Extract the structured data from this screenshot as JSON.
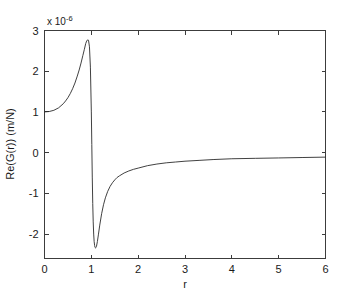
{
  "chart_data": {
    "type": "line",
    "title": "",
    "subtitle": "",
    "xlabel": "r",
    "ylabel": "Re(G(r)) (m/N)",
    "y_multiplier": "x 10",
    "y_multiplier_exponent": "-6",
    "y_multiplier_full": "x 10^-6",
    "xlim": [
      0,
      6
    ],
    "ylim": [
      -2.6,
      3
    ],
    "xticks": [
      0,
      1,
      2,
      3,
      4,
      5,
      6
    ],
    "xtick_labels": [
      "0",
      "1",
      "2",
      "3",
      "4",
      "5",
      "6"
    ],
    "yticks": [
      -2,
      -1,
      0,
      1,
      2,
      3
    ],
    "ytick_labels": [
      "-2",
      "-1",
      "0",
      "1",
      "2",
      "3"
    ],
    "grid": false,
    "legend": null,
    "legend_position": "none",
    "line_color": "#2b2b2b",
    "axis_color": "#3c3c3c",
    "background_color": "#ffffff",
    "annotations": [
      {
        "name": "resonance-peak",
        "x": 0.94,
        "y": 2.77
      },
      {
        "name": "resonance-trough",
        "x": 1.11,
        "y": -2.34
      },
      {
        "name": "left-endpoint",
        "x": 0.0,
        "y": 1.0
      },
      {
        "name": "right-endpoint",
        "x": 6.0,
        "y": -0.11
      }
    ],
    "series": [
      {
        "name": "Re(G(r))",
        "x": [
          0.0,
          0.1,
          0.2,
          0.3,
          0.4,
          0.45,
          0.5,
          0.55,
          0.6,
          0.65,
          0.7,
          0.74,
          0.78,
          0.82,
          0.85,
          0.88,
          0.9,
          0.92,
          0.94,
          0.96,
          0.98,
          1.0,
          1.01,
          1.02,
          1.03,
          1.04,
          1.05,
          1.06,
          1.07,
          1.08,
          1.09,
          1.1,
          1.11,
          1.13,
          1.15,
          1.18,
          1.22,
          1.26,
          1.3,
          1.35,
          1.4,
          1.45,
          1.5,
          1.55,
          1.6,
          1.7,
          1.8,
          1.9,
          2.0,
          2.2,
          2.4,
          2.6,
          2.8,
          3.0,
          3.3,
          3.6,
          4.0,
          4.5,
          5.0,
          5.5,
          6.0
        ],
        "y": [
          1.0,
          1.01,
          1.04,
          1.1,
          1.2,
          1.27,
          1.35,
          1.45,
          1.57,
          1.71,
          1.88,
          2.03,
          2.2,
          2.39,
          2.53,
          2.68,
          2.74,
          2.77,
          2.76,
          2.6,
          2.1,
          1.0,
          0.2,
          -0.6,
          -1.25,
          -1.7,
          -2.0,
          -2.18,
          -2.28,
          -2.33,
          -2.34,
          -2.33,
          -2.3,
          -2.18,
          -2.02,
          -1.78,
          -1.5,
          -1.28,
          -1.11,
          -0.95,
          -0.83,
          -0.74,
          -0.67,
          -0.61,
          -0.57,
          -0.5,
          -0.45,
          -0.41,
          -0.38,
          -0.32,
          -0.28,
          -0.25,
          -0.23,
          -0.21,
          -0.19,
          -0.17,
          -0.15,
          -0.14,
          -0.13,
          -0.12,
          -0.11
        ]
      }
    ]
  },
  "figure": {
    "name": "re-g-r-plot"
  }
}
